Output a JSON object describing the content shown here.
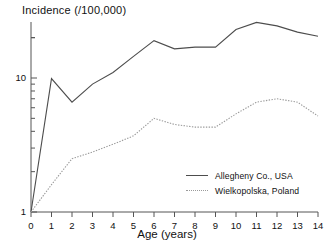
{
  "chart_data": {
    "type": "line",
    "title": "Incidence (/100,000)",
    "xlabel": "Age (years)",
    "ylabel": "Incidence (/100,000)",
    "yscale": "log",
    "ylim": [
      1,
      40
    ],
    "xlim": [
      0,
      14
    ],
    "grid": false,
    "legend_position": "lower-right",
    "y_tick_labels": [
      "1",
      "10"
    ],
    "y_tick_values": [
      1,
      10
    ],
    "x_tick_labels": [
      "0",
      "1",
      "2",
      "3",
      "4",
      "5",
      "6",
      "7",
      "8",
      "9",
      "10",
      "11",
      "12",
      "13",
      "14"
    ],
    "x": [
      0,
      1,
      2,
      3,
      4,
      5,
      6,
      7,
      8,
      9,
      10,
      11,
      12,
      13,
      14
    ],
    "series": [
      {
        "name": "Allegheny Co., USA",
        "style": "solid",
        "color": "#4d4d4d",
        "values": [
          1.0,
          9.9,
          6.6,
          9.0,
          11.0,
          14.5,
          19.0,
          16.5,
          17.0,
          17.0,
          23.0,
          26.0,
          24.5,
          22.0,
          20.5
        ]
      },
      {
        "name": "Wielkopolska, Poland",
        "style": "dotted",
        "color": "#9a9a9a",
        "values": [
          1.0,
          1.6,
          2.5,
          2.8,
          3.2,
          3.7,
          5.0,
          4.5,
          4.3,
          4.3,
          5.4,
          6.6,
          7.0,
          6.6,
          5.2
        ]
      }
    ]
  },
  "legend": {
    "entries": [
      {
        "label": "Allegheny Co., USA"
      },
      {
        "label": "Wielkopolska, Poland"
      }
    ]
  }
}
